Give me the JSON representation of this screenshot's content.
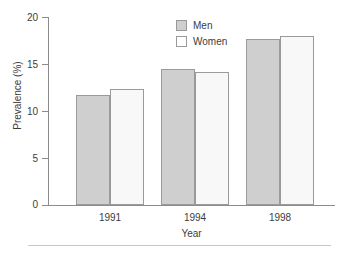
{
  "chart_data": {
    "type": "bar",
    "title": "",
    "subtitle": "",
    "xlabel": "Year",
    "ylabel": "Prevalence (%)",
    "categories": [
      "1991",
      "1994",
      "1998"
    ],
    "series": [
      {
        "name": "Men",
        "values": [
          11.7,
          14.5,
          17.7
        ],
        "color": "#cfcfcf"
      },
      {
        "name": "Women",
        "values": [
          12.3,
          14.1,
          18.0
        ],
        "color": "#f8f8f8"
      }
    ],
    "ylim": [
      0,
      20
    ],
    "yticks": [
      0,
      5,
      10,
      15,
      20
    ],
    "ytick_labels": [
      "0",
      "5",
      "10",
      "15",
      "20"
    ],
    "grid": false,
    "legend_position": "top-center",
    "annotations": []
  },
  "axes": {
    "y_title": "Prevalence (%)",
    "x_title": "Year",
    "y_tick_labels": [
      "20",
      "15",
      "10",
      "5",
      "0"
    ],
    "x_tick_labels": [
      "1991",
      "1994",
      "1998"
    ]
  },
  "legend": {
    "entries": [
      {
        "label": "Men",
        "swatch": "filled-gray-square"
      },
      {
        "label": "Women",
        "swatch": "open-white-square"
      }
    ]
  },
  "footer": {
    "rule": "horizontal-rule"
  }
}
